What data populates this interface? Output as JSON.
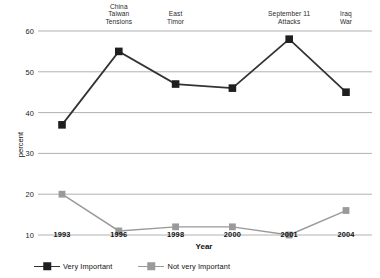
{
  "chart_data": {
    "type": "line",
    "title": "",
    "xlabel": "Year",
    "ylabel": "percent",
    "categories": [
      "1993",
      "1996",
      "1998",
      "2000",
      "2001",
      "2004"
    ],
    "ylim": [
      5,
      62
    ],
    "yticks": [
      10,
      20,
      30,
      40,
      50,
      60
    ],
    "ytick_labels": [
      "10",
      "20",
      "30",
      "40",
      "50",
      "60"
    ],
    "grid": true,
    "legend_position": "bottom-left",
    "series": [
      {
        "name": "Very Important",
        "color": "#333333",
        "marker": "square",
        "values": [
          37,
          55,
          47,
          46,
          58,
          45
        ]
      },
      {
        "name": "Not very Important",
        "color": "#999999",
        "marker": "square",
        "values": [
          20,
          11,
          12,
          12,
          10,
          16
        ]
      }
    ],
    "annotations": [
      {
        "text": "China\nTaiwan\nTensions",
        "category": "1996"
      },
      {
        "text": "East\nTimor",
        "category": "1998"
      },
      {
        "text": "September 11\nAttacks",
        "category": "2001"
      },
      {
        "text": "Iraq\nWar",
        "category": "2004"
      }
    ]
  },
  "colors": {
    "very_important": "#333333",
    "not_very_important": "#999999",
    "gridline": "#a8a8a8",
    "background": "#ffffff"
  },
  "legend": {
    "items": [
      {
        "label": "Very Important",
        "color": "#333333"
      },
      {
        "label": "Not very Important",
        "color": "#999999"
      }
    ]
  },
  "axes": {
    "x_title": "Year",
    "y_title": "percent"
  }
}
